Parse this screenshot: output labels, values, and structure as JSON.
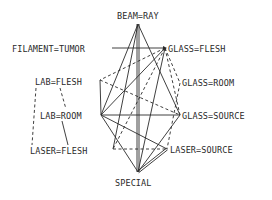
{
  "diagram": {
    "type": "network-graph",
    "line_color": "#2a2a2a",
    "background": "#ffffff",
    "legend": {
      "solid": "solid edge",
      "dashed": "dashed edge",
      "double": "double edge"
    },
    "nodes": [
      {
        "id": "beam-ray",
        "label": "BEAM=RAY",
        "x": 138,
        "y": 24,
        "lx": 117,
        "ly": 11
      },
      {
        "id": "filament-tumor",
        "label": "FILAMENT=TUMOR",
        "x": 112,
        "y": 48,
        "lx": 12,
        "ly": 44
      },
      {
        "id": "glass-flesh",
        "label": "GLASS=FLESH",
        "x": 165,
        "y": 48,
        "lx": 168,
        "ly": 44
      },
      {
        "id": "lab-flesh",
        "label": "LAB=FLESH",
        "x": 100,
        "y": 80,
        "lx": 35,
        "ly": 77
      },
      {
        "id": "glass-room",
        "label": "GLASS=ROOM",
        "x": 180,
        "y": 83,
        "lx": 182,
        "ly": 78
      },
      {
        "id": "lab-room",
        "label": "LAB=ROOM",
        "x": 101,
        "y": 115,
        "lx": 40,
        "ly": 111
      },
      {
        "id": "glass-source",
        "label": "GLASS=SOURCE",
        "x": 180,
        "y": 115,
        "lx": 182,
        "ly": 111
      },
      {
        "id": "laser-flesh",
        "label": "LASER=FLESH",
        "x": 113,
        "y": 149,
        "lx": 30,
        "ly": 146
      },
      {
        "id": "laser-source",
        "label": "LASER=SOURCE",
        "x": 167,
        "y": 149,
        "lx": 170,
        "ly": 145
      },
      {
        "id": "special",
        "label": "SPECIAL",
        "x": 138,
        "y": 172,
        "lx": 115,
        "ly": 178
      }
    ],
    "edges": [
      {
        "from": "filament-tumor",
        "to": "glass-flesh",
        "style": "solid"
      },
      {
        "from": "beam-ray",
        "to": "special",
        "style": "double"
      },
      {
        "from": "beam-ray",
        "to": "lab-room",
        "style": "solid"
      },
      {
        "from": "beam-ray",
        "to": "laser-flesh",
        "style": "solid"
      },
      {
        "from": "beam-ray",
        "to": "glass-source",
        "style": "solid"
      },
      {
        "from": "glass-flesh",
        "to": "lab-room",
        "style": "solid"
      },
      {
        "from": "glass-flesh",
        "to": "special",
        "style": "solid"
      },
      {
        "from": "glass-flesh",
        "to": "lab-flesh",
        "style": "dashed"
      },
      {
        "from": "glass-flesh",
        "to": "laser-flesh",
        "style": "dashed"
      },
      {
        "from": "glass-flesh",
        "to": "glass-source",
        "style": "dashed"
      },
      {
        "from": "glass-flesh",
        "to": "glass-room",
        "style": "dashed"
      },
      {
        "from": "lab-flesh",
        "to": "lab-room",
        "style": "solid"
      },
      {
        "from": "lab-flesh",
        "to": "glass-source",
        "style": "dashed"
      },
      {
        "from": "lab-room",
        "to": "glass-source",
        "style": "solid"
      },
      {
        "from": "lab-room",
        "to": "laser-source",
        "style": "solid"
      },
      {
        "from": "lab-room",
        "to": "special",
        "style": "solid"
      },
      {
        "from": "glass-source",
        "to": "special",
        "style": "solid"
      },
      {
        "from": "laser-flesh",
        "to": "laser-source",
        "style": "dashed"
      },
      {
        "from": "laser-source",
        "to": "special",
        "style": "double"
      },
      {
        "from": "glass-room",
        "to": "laser-source",
        "style": "dashed"
      },
      {
        "from": "lab-flesh-label",
        "to": "lab-room-label",
        "style": "dashed"
      },
      {
        "from": "lab-flesh-label",
        "to": "laser-flesh-label",
        "style": "dashed"
      },
      {
        "from": "lab-room-label",
        "to": "laser-flesh-label",
        "style": "solid"
      }
    ]
  }
}
